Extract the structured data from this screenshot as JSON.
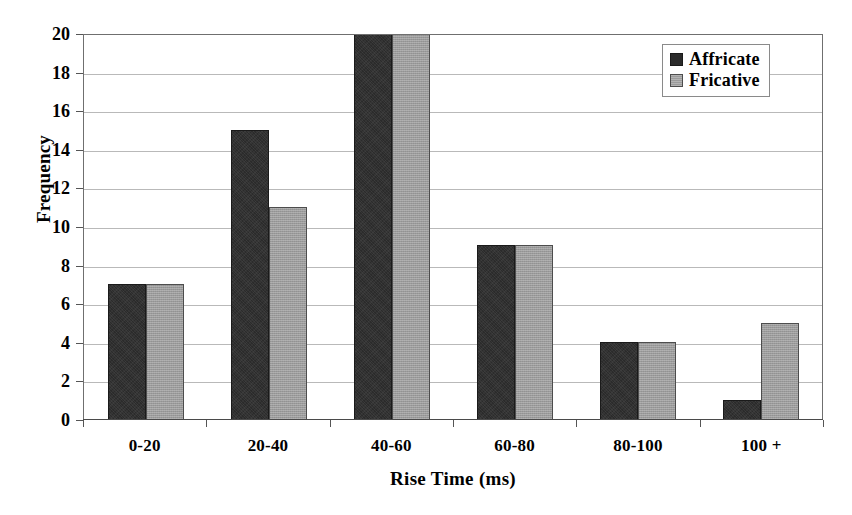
{
  "chart_data": {
    "type": "bar",
    "title": "",
    "xlabel": "Rise Time (ms)",
    "ylabel": "Frequency",
    "categories": [
      "0-20",
      "20-40",
      "40-60",
      "60-80",
      "80-100",
      "100 +"
    ],
    "series": [
      {
        "name": "Affricate",
        "color": "#2b2b2b",
        "values": [
          7,
          15,
          20,
          9,
          4,
          1
        ]
      },
      {
        "name": "Fricative",
        "color": "#9b9b9b",
        "values": [
          7,
          11,
          20,
          9,
          4,
          5
        ]
      }
    ],
    "ylim": [
      0,
      20
    ],
    "y_ticks": [
      0,
      2,
      4,
      6,
      8,
      10,
      12,
      14,
      16,
      18,
      20
    ],
    "y_tick_labels": [
      "0",
      "2",
      "4",
      "6",
      "8",
      "10",
      "12",
      "14",
      "16",
      "18",
      "20"
    ],
    "grid": true,
    "grid_axis": "y",
    "legend_position": "top-right",
    "legend_entries": [
      "Affricate",
      "Fricative"
    ]
  },
  "axis": {
    "y_title": "Frequency",
    "x_title": "Rise Time (ms)"
  },
  "legend": {
    "items": [
      {
        "label": "Affricate"
      },
      {
        "label": "Fricative"
      }
    ]
  }
}
